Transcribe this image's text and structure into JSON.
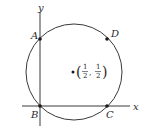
{
  "diagram": {
    "axes": {
      "x_label": "x",
      "y_label": "y"
    },
    "circle": {
      "center_label": {
        "open_paren": "(",
        "close_paren": ")",
        "comma": ",",
        "x_num": "1",
        "x_den": "2",
        "y_num": "1",
        "y_den": "2"
      }
    },
    "points": [
      {
        "label": "A",
        "position": "top-left, on y-axis"
      },
      {
        "label": "D",
        "position": "top-right"
      },
      {
        "label": "B",
        "position": "origin"
      },
      {
        "label": "C",
        "position": "bottom-right, on x-axis"
      }
    ],
    "colors": {
      "stroke": "#3a3a3a",
      "point": "#1a1a1a",
      "background": "#ffffff"
    }
  }
}
